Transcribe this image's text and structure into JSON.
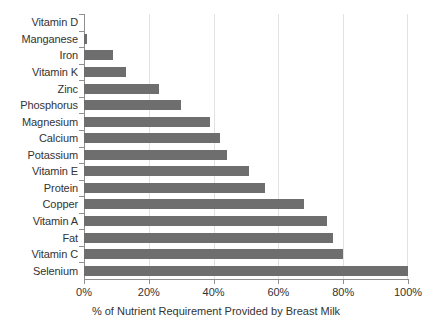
{
  "chart_data": {
    "type": "bar",
    "orientation": "horizontal",
    "title": "",
    "subtitle": "",
    "xlabel": "% of Nutrient Requirement Provided by Breast Milk",
    "ylabel": "",
    "categories": [
      "Vitamin D",
      "Manganese",
      "Iron",
      "Vitamin K",
      "Zinc",
      "Phosphorus",
      "Magnesium",
      "Calcium",
      "Potassium",
      "Vitamin E",
      "Protein",
      "Copper",
      "Vitamin A",
      "Fat",
      "Vitamin C",
      "Selenium"
    ],
    "values": [
      0,
      1,
      9,
      13,
      23,
      30,
      39,
      42,
      44,
      51,
      56,
      68,
      75,
      77,
      80,
      100
    ],
    "value_unit": "%",
    "xlim": [
      0,
      100
    ],
    "x_ticks": [
      0,
      20,
      40,
      60,
      80,
      100
    ],
    "x_tick_labels": [
      "0%",
      "20%",
      "40%",
      "60%",
      "80%",
      "100%"
    ],
    "grid": true,
    "grid_axis": "x",
    "legend": false,
    "legend_position": "none",
    "bar_color": "#6e6e6e",
    "gridline_color": "#e2e2e2",
    "axis_color": "#8f8f8f",
    "text_color": "#333333",
    "background_color": "#ffffff"
  }
}
